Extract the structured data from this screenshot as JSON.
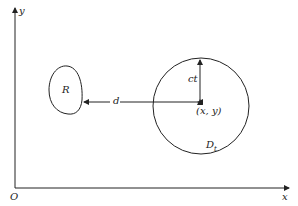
{
  "diagram": {
    "axes": {
      "x_label": "x",
      "y_label": "y",
      "origin_label": "O"
    },
    "region": {
      "label": "R"
    },
    "disk": {
      "label": "D",
      "subscript": "t",
      "center_label": "(x, y)",
      "radius_label": "ct"
    },
    "distance_label": "d",
    "colors": {
      "stroke": "#222222",
      "background": "#ffffff"
    }
  }
}
